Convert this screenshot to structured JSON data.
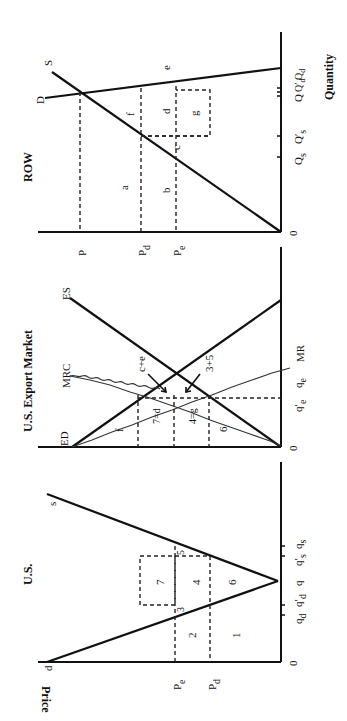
{
  "figure": {
    "orientation": "rotated 90 degrees counter-clockwise",
    "panels": [
      {
        "id": "us",
        "title": "U.S.",
        "y_axis_label": "Price",
        "origin_label": "0",
        "curves": [
          "d",
          "s"
        ],
        "price_labels": [
          "Pe",
          "Pd"
        ],
        "quantity_labels": [
          "qd",
          "q'd",
          "q",
          "q's",
          "qs"
        ],
        "areas": [
          "1",
          "2",
          "3",
          "4",
          "5",
          "6",
          "7"
        ]
      },
      {
        "id": "export",
        "title": "U.S. Export Market",
        "origin_label": "0",
        "curves": [
          "ED",
          "ES",
          "MRC",
          "MR"
        ],
        "quantity_labels": [
          "q'e",
          "qe"
        ],
        "areas": [
          "f",
          "7=d",
          "4=g",
          "6",
          "c+e",
          "3+5"
        ]
      },
      {
        "id": "row",
        "title": "ROW",
        "x_axis_label": "Quantity",
        "origin_label": "0",
        "curves": [
          "D",
          "S"
        ],
        "price_labels": [
          "P",
          "Pd",
          "Pe"
        ],
        "quantity_labels": [
          "Qs",
          "Q's",
          "Q",
          "Q'd",
          "Qd"
        ],
        "areas": [
          "a",
          "b",
          "c",
          "d",
          "e",
          "f",
          "g"
        ]
      }
    ]
  },
  "labels": {
    "us_title": "U.S.",
    "us_price": "Price",
    "us_zero": "0",
    "us_zero_q": "0",
    "us_d": "d",
    "us_s": "s",
    "us_pe": "P",
    "us_pe_sub": "e",
    "us_pd": "P",
    "us_pd_sub": "d",
    "us_qd": "q",
    "us_qd_sub": "d",
    "us_qdp": "q′",
    "us_qdp_sub": "d",
    "us_q": "q",
    "us_qsp": "q′",
    "us_qsp_sub": "s",
    "us_qs": "q",
    "us_qs_sub": "s",
    "us_a1": "1",
    "us_a2": "2",
    "us_a3": "3",
    "us_a4": "4",
    "us_a5": "5",
    "us_a6": "6",
    "us_a7": "7",
    "ex_title": "U.S.  Export  Market",
    "ex_zero": "0",
    "ex_zero_q": "0",
    "ex_ed": "ED",
    "ex_es": "ES",
    "ex_mrc": "MRC",
    "ex_mr": "MR",
    "ex_qep": "q′",
    "ex_qep_sub": "e",
    "ex_qe": "q",
    "ex_qe_sub": "e",
    "ex_f": "f",
    "ex_7d": "7=d",
    "ex_4g": "4=g",
    "ex_6": "6",
    "ex_ce": "c+e",
    "ex_35": "3+5",
    "row_title": "ROW",
    "row_quantity": "Quantity",
    "row_zero": "0",
    "row_D": "D",
    "row_S": "S",
    "row_P": "P",
    "row_Pd": "P",
    "row_Pd_sub": "d",
    "row_Pe": "P",
    "row_Pe_sub": "e",
    "row_Qs": "Q",
    "row_Qs_sub": "s",
    "row_Qsp": "Q′",
    "row_Qsp_sub": "s",
    "row_Q": "Q",
    "row_Qdp": "Q′",
    "row_Qdp_sub": "d",
    "row_Qd": "Q",
    "row_Qd_sub": "d",
    "row_a": "a",
    "row_b": "b",
    "row_c": "c",
    "row_d": "d",
    "row_e": "e",
    "row_f": "f",
    "row_g": "g"
  },
  "colors": {
    "ink": "#111111",
    "background": "#ffffff"
  }
}
